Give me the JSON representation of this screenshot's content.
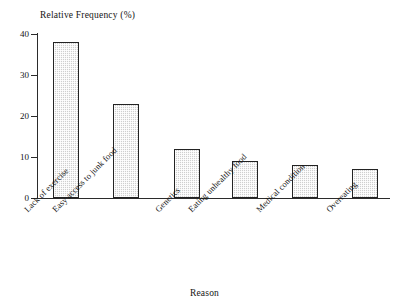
{
  "chart_data": {
    "type": "bar",
    "title": "",
    "xlabel": "Reason",
    "ylabel": "Relative Frequency (%)",
    "categories": [
      "Lack of exercise",
      "Easy access to junk food",
      "Genetics",
      "Eating unhealthy food",
      "Medical condition",
      "Overeating"
    ],
    "values": [
      38,
      23,
      12,
      9,
      8,
      7
    ],
    "ylim": [
      0,
      40
    ],
    "yticks": [
      0,
      10,
      20,
      30,
      40
    ],
    "ytick_labels": [
      "0",
      "10",
      "20",
      "30",
      "40"
    ],
    "grid": false,
    "legend": "none",
    "bar_fill_color": "#cfcfcf",
    "bar_edge_color": "#232323",
    "background_color": "#ffffff",
    "axis_color": "#2b2b2b"
  }
}
